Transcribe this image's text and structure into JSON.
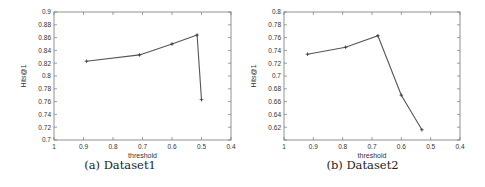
{
  "chart_data": [
    {
      "type": "line",
      "title": "",
      "caption": "(a) Dataset1",
      "xlabel": "threshold",
      "ylabel": "Hits@1",
      "xlim": [
        1,
        0.4
      ],
      "ylim": [
        0.7,
        0.9
      ],
      "x_reversed": true,
      "xticks": [
        1,
        0.9,
        0.8,
        0.7,
        0.6,
        0.5,
        0.4
      ],
      "xtick_labels": [
        "1",
        "0.9",
        "0.8",
        "0.7",
        "0.6",
        "0.5",
        "0.4"
      ],
      "yticks": [
        0.7,
        0.72,
        0.74,
        0.76,
        0.78,
        0.8,
        0.82,
        0.84,
        0.86,
        0.88,
        0.9
      ],
      "ytick_labels": [
        "0.7",
        "0.72",
        "0.74",
        "0.76",
        "0.78",
        "0.8",
        "0.82",
        "0.84",
        "0.86",
        "0.88",
        "0.9"
      ],
      "grid": false,
      "series": [
        {
          "name": "Dataset1",
          "color": "#555555",
          "marker": "+",
          "x": [
            0.89,
            0.71,
            0.6,
            0.515,
            0.5
          ],
          "y": [
            0.823,
            0.833,
            0.85,
            0.864,
            0.763
          ]
        }
      ]
    },
    {
      "type": "line",
      "title": "",
      "caption": "(b) Dataset2",
      "xlabel": "threshold",
      "ylabel": "Hits@1",
      "xlim": [
        1,
        0.4
      ],
      "ylim": [
        0.6,
        0.8
      ],
      "x_reversed": true,
      "xticks": [
        1,
        0.9,
        0.8,
        0.7,
        0.6,
        0.5,
        0.4
      ],
      "xtick_labels": [
        "1",
        "0.9",
        "0.8",
        "0.7",
        "0.6",
        "0.5",
        "0.4"
      ],
      "yticks": [
        0.6,
        0.62,
        0.64,
        0.66,
        0.68,
        0.7,
        0.72,
        0.74,
        0.76,
        0.78,
        0.8
      ],
      "ytick_labels": [
        "",
        "0.62",
        "0.64",
        "0.66",
        "0.68",
        "0.7",
        "0.72",
        "0.74",
        "0.76",
        "0.78",
        "0.8"
      ],
      "grid": false,
      "series": [
        {
          "name": "Dataset2",
          "color": "#555555",
          "marker": "+",
          "x": [
            0.92,
            0.79,
            0.68,
            0.6,
            0.53
          ],
          "y": [
            0.734,
            0.745,
            0.763,
            0.67,
            0.616
          ]
        }
      ]
    }
  ],
  "layout": {
    "panels": [
      {
        "frame": {
          "left": 54,
          "top": 12,
          "right": 231,
          "bottom": 140
        }
      },
      {
        "frame": {
          "left": 44,
          "top": 12,
          "right": 220,
          "bottom": 140
        }
      }
    ]
  }
}
